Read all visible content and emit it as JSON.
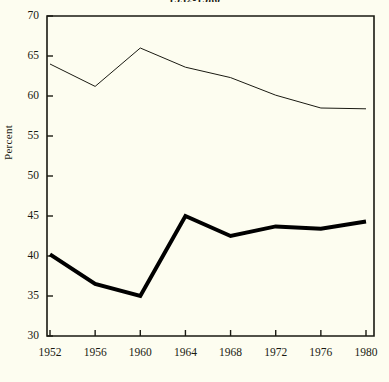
{
  "chart_data": {
    "type": "line",
    "title": "1952-1980",
    "xlabel": "",
    "ylabel": "Percent",
    "x": [
      1952,
      1956,
      1960,
      1964,
      1968,
      1972,
      1976,
      1980
    ],
    "xtick_labels": [
      "1952",
      "1956",
      "1960",
      "1964",
      "1968",
      "1972",
      "1976",
      "1980"
    ],
    "ytick_labels": [
      "30",
      "35",
      "40",
      "45",
      "50",
      "55",
      "60",
      "65",
      "70"
    ],
    "ytick_values": [
      30,
      35,
      40,
      45,
      50,
      55,
      60,
      65,
      70
    ],
    "ylim": [
      30,
      70
    ],
    "xlim": [
      1950,
      1982
    ],
    "grid": false,
    "legend": "none",
    "series": [
      {
        "name": "upper-thin-line",
        "style": "thin",
        "color": "#1a1a12",
        "linewidth": 1,
        "values": [
          64.0,
          61.2,
          66.0,
          63.6,
          62.3,
          60.1,
          58.5,
          58.4
        ]
      },
      {
        "name": "lower-thick-line",
        "style": "thick",
        "color": "#000000",
        "linewidth": 4,
        "values": [
          40.2,
          36.5,
          35.0,
          45.0,
          42.5,
          43.7,
          43.4,
          44.3
        ]
      }
    ],
    "axis_color": "#1a1a12",
    "background_color": "#fdfdf0"
  }
}
